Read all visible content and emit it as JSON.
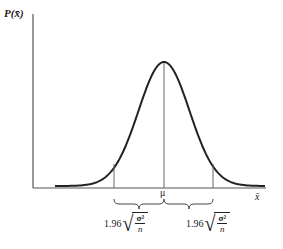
{
  "chart_data": {
    "type": "line",
    "title": "",
    "ylabel": "P(x̄)",
    "xlabel": "x̄",
    "grid": false,
    "legend": null,
    "series": [
      {
        "name": "sampling distribution of the mean",
        "shape": "normal curve",
        "center": "μ"
      }
    ],
    "x_tick_labels": [
      "μ"
    ],
    "vertical_markers": [
      "μ − 1.96√(σ²/n)",
      "μ",
      "μ + 1.96√(σ²/n)"
    ],
    "annotations": [
      {
        "type": "brace",
        "span": "lower marker to μ",
        "label": "1.96√(σ²/n)"
      },
      {
        "type": "brace",
        "span": "μ to upper marker",
        "label": "1.96√(σ²/n)"
      }
    ]
  },
  "labels": {
    "y_axis": "P(x̄)",
    "x_axis": "x̄",
    "mean": "μ",
    "left_interval": {
      "coef": "1.96",
      "num": "σ²",
      "den": "n"
    },
    "right_interval": {
      "coef": "1.96",
      "num": "σ²",
      "den": "n"
    }
  },
  "colors": {
    "axis": "#555555",
    "curve": "#222222",
    "marker": "#666666"
  }
}
